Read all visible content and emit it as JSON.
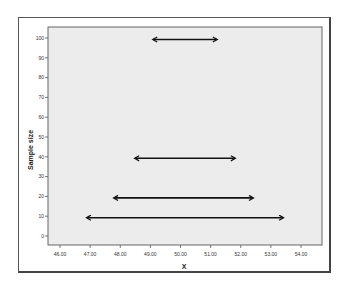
{
  "chart_data": {
    "type": "interval",
    "title": "",
    "xlabel": "X",
    "ylabel": "Sample size",
    "xlim": [
      45.6,
      54.8
    ],
    "ylim": [
      -5,
      105
    ],
    "x_ticks": [
      "46.00",
      "47.00",
      "48.00",
      "49.00",
      "50.00",
      "51.00",
      "52.00",
      "53.00",
      "54.00"
    ],
    "y_ticks": [
      "0",
      "10",
      "20",
      "30",
      "40",
      "50",
      "60",
      "70",
      "80",
      "90",
      "100"
    ],
    "grid": false,
    "legend": null,
    "intervals": [
      {
        "sample_size": 100,
        "lower": 49.1,
        "upper": 51.2
      },
      {
        "sample_size": 40,
        "lower": 48.5,
        "upper": 51.8
      },
      {
        "sample_size": 20,
        "lower": 47.8,
        "upper": 52.4
      },
      {
        "sample_size": 10,
        "lower": 46.9,
        "upper": 53.4
      }
    ],
    "colors": {
      "plot_background": "#ececec",
      "arrow": "#111111",
      "frame": "#555555"
    }
  }
}
